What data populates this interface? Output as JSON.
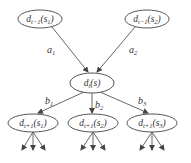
{
  "diagram": {
    "nodes": [
      {
        "id": "prev1",
        "base": "d",
        "sub": "t−1",
        "arg": "s",
        "argsub": "1",
        "cx": 40,
        "cy": 19,
        "rx": 22,
        "ry": 9
      },
      {
        "id": "prev2",
        "base": "d",
        "sub": "t−1",
        "arg": "s",
        "argsub": "2",
        "cx": 147,
        "cy": 19,
        "rx": 22,
        "ry": 9
      },
      {
        "id": "current",
        "base": "d",
        "sub": "t",
        "arg": "s",
        "argsub": "",
        "cx": 92,
        "cy": 83,
        "rx": 22,
        "ry": 10
      },
      {
        "id": "next1",
        "base": "d",
        "sub": "t+1",
        "arg": "s",
        "argsub": "1",
        "cx": 33,
        "cy": 123,
        "rx": 25,
        "ry": 9
      },
      {
        "id": "next2",
        "base": "d",
        "sub": "t+1",
        "arg": "s",
        "argsub": "2",
        "cx": 93,
        "cy": 123,
        "rx": 25,
        "ry": 9
      },
      {
        "id": "next3",
        "base": "d",
        "sub": "t+1",
        "arg": "s",
        "argsub": "3",
        "cx": 152,
        "cy": 123,
        "rx": 25,
        "ry": 9
      }
    ],
    "edges": [
      {
        "from": "prev1",
        "to": "current",
        "label": "a",
        "labelsub": "1"
      },
      {
        "from": "prev2",
        "to": "current",
        "label": "a",
        "labelsub": "2"
      },
      {
        "from": "current",
        "to": "next1",
        "label": "b",
        "labelsub": "1"
      },
      {
        "from": "current",
        "to": "next2",
        "label": "b",
        "labelsub": "2"
      },
      {
        "from": "current",
        "to": "next3",
        "label": "b",
        "labelsub": "3"
      }
    ],
    "labels": {
      "a1": {
        "main": "a",
        "sub": "1"
      },
      "a2": {
        "main": "a",
        "sub": "2"
      },
      "b1": {
        "main": "b",
        "sub": "1"
      },
      "b2": {
        "main": "b",
        "sub": "2"
      },
      "b3": {
        "main": "b",
        "sub": "3"
      }
    },
    "node_text": {
      "prev1": {
        "d": "d",
        "sub": "t−1",
        "open": "(",
        "s": "s",
        "ssub": "1",
        "close": ")"
      },
      "prev2": {
        "d": "d",
        "sub": "t−1",
        "open": "(",
        "s": "s",
        "ssub": "2",
        "close": ")"
      },
      "current": {
        "d": "d",
        "sub": "t",
        "open": "(",
        "s": "s",
        "ssub": "",
        "close": ")"
      },
      "next1": {
        "d": "d",
        "sub": "t+1",
        "open": "(",
        "s": "s",
        "ssub": "1",
        "close": ")"
      },
      "next2": {
        "d": "d",
        "sub": "t+1",
        "open": "(",
        "s": "s",
        "ssub": "2",
        "close": ")"
      },
      "next3": {
        "d": "d",
        "sub": "t+1",
        "open": "(",
        "s": "s",
        "ssub": "3",
        "close": ")"
      }
    },
    "colors": {
      "stroke": "#555555",
      "text": "#333333",
      "background": "#ffffff"
    }
  }
}
